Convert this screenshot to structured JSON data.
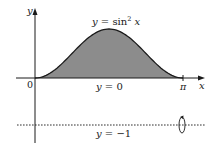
{
  "figure": {
    "fill_color": "#8c8c8c",
    "curve_color": "#1a1a1a",
    "axis_color": "#1a1a1a"
  },
  "chart_data": {
    "type": "area",
    "title": "",
    "xlabel": "x",
    "ylabel": "y",
    "x_range": [
      0,
      3.14159
    ],
    "y_range": [
      -1,
      1
    ],
    "series": [
      {
        "name": "y = sin^2 x",
        "function": "sin^2(x)",
        "x_start": 0,
        "x_end": 3.14159,
        "shaded": true
      }
    ],
    "reference_lines": [
      {
        "name": "y = 0",
        "y": 0,
        "style": "solid"
      },
      {
        "name": "y = -1",
        "y": -1,
        "style": "dashed",
        "axis_of_rotation": true
      }
    ],
    "x_ticks": [
      {
        "value": 0,
        "label": "0"
      },
      {
        "value": 3.14159,
        "label": "π"
      }
    ]
  },
  "labels": {
    "y_axis": "y",
    "x_axis": "x",
    "origin": "0",
    "pi": "π",
    "curve_y": "y",
    "curve_eq": " = sin",
    "curve_exp": "2",
    "curve_x": " x",
    "line_zero_y": "y",
    "line_zero_eq": " = 0",
    "line_neg_y": "y",
    "line_neg_eq": " = −1"
  }
}
